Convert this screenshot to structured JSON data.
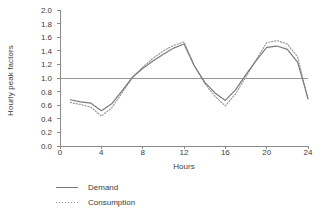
{
  "chart_data": {
    "type": "line",
    "title": "",
    "xlabel": "Hours",
    "ylabel": "Hourly peak factors",
    "xlim": [
      0,
      24
    ],
    "ylim": [
      0.0,
      2.0
    ],
    "xticks": [
      "0",
      "4",
      "8",
      "12",
      "16",
      "20",
      "24"
    ],
    "xtick_values": [
      0,
      4,
      8,
      12,
      16,
      20,
      24
    ],
    "yticks": [
      "0.0",
      "0.2",
      "0.4",
      "0.6",
      "0.8",
      "1.0",
      "1.2",
      "1.4",
      "1.6",
      "1.8",
      "2.0"
    ],
    "ytick_values": [
      0.0,
      0.2,
      0.4,
      0.6,
      0.8,
      1.0,
      1.2,
      1.4,
      1.6,
      1.8,
      2.0
    ],
    "grid": false,
    "reference_line": {
      "y": 1.0,
      "style": "solid",
      "color": "#8c8c8c"
    },
    "legend_position": "below-left",
    "x": [
      1,
      2,
      3,
      4,
      5,
      6,
      7,
      8,
      9,
      10,
      11,
      12,
      13,
      14,
      15,
      16,
      17,
      18,
      19,
      20,
      21,
      22,
      23,
      24
    ],
    "series": [
      {
        "name": "Demand",
        "style": "solid",
        "color": "#7a7a7a",
        "values": [
          0.68,
          0.65,
          0.63,
          0.52,
          0.62,
          0.81,
          1.01,
          1.14,
          1.25,
          1.35,
          1.44,
          1.5,
          1.18,
          0.94,
          0.78,
          0.67,
          0.83,
          1.05,
          1.26,
          1.45,
          1.47,
          1.42,
          1.23,
          0.7
        ]
      },
      {
        "name": "Consumption",
        "style": "dotted",
        "color": "#9a9a9a",
        "values": [
          0.64,
          0.61,
          0.57,
          0.44,
          0.56,
          0.78,
          1.0,
          1.16,
          1.29,
          1.4,
          1.48,
          1.53,
          1.18,
          0.92,
          0.73,
          0.59,
          0.77,
          1.02,
          1.27,
          1.52,
          1.55,
          1.5,
          1.31,
          0.68
        ]
      }
    ]
  },
  "legend": {
    "items": [
      {
        "label": "Demand",
        "style": "solid",
        "color": "#7a7a7a"
      },
      {
        "label": "Consumption",
        "style": "dotted",
        "color": "#9a9a9a"
      }
    ]
  },
  "axes": {
    "spine_color": "#8a8a8a",
    "tick_color": "#8a8a8a",
    "text_color": "#3d3d3d"
  }
}
